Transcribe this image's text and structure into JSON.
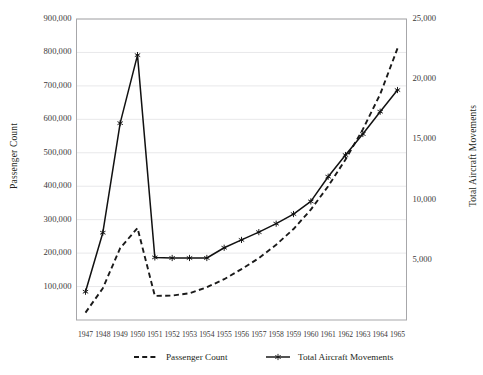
{
  "chart_data": {
    "type": "line",
    "title": "",
    "xlabel": "",
    "categories": [
      "1947",
      "1948",
      "1949",
      "1950",
      "1951",
      "1952",
      "1953",
      "1954",
      "1955",
      "1956",
      "1957",
      "1958",
      "1959",
      "1960",
      "1961",
      "1962",
      "1963",
      "1964",
      "1965"
    ],
    "grid": true,
    "legend_position": "bottom",
    "axes": {
      "left": {
        "label": "Passenger Count",
        "ticks": [
          "100,000",
          "200,000",
          "300,000",
          "400,000",
          "500,000",
          "600,000",
          "700,000",
          "800,000",
          "900,000"
        ],
        "tick_values": [
          100000,
          200000,
          300000,
          400000,
          500000,
          600000,
          700000,
          800000,
          900000
        ],
        "lim": [
          0,
          900000
        ]
      },
      "right": {
        "label": "Total Aircraft Movements",
        "ticks": [
          "5,000",
          "10,000",
          "15,000",
          "20,000",
          "25,000"
        ],
        "tick_values": [
          5000,
          10000,
          15000,
          20000,
          25000
        ],
        "lim": [
          0,
          25000
        ]
      }
    },
    "series": [
      {
        "name": "Passenger Count",
        "axis": "left",
        "style": "dashed",
        "marker": "none",
        "color": "#1a1a1a",
        "values": [
          22000,
          95000,
          215000,
          275000,
          72000,
          73000,
          80000,
          98000,
          122000,
          152000,
          185000,
          225000,
          272000,
          330000,
          400000,
          480000,
          570000,
          675000,
          812000
        ]
      },
      {
        "name": "Total Aircraft Movements",
        "axis": "right",
        "style": "solid",
        "marker": "asterisk",
        "color": "#111111",
        "values": [
          2350,
          7250,
          16350,
          22000,
          5200,
          5150,
          5150,
          5150,
          6000,
          6650,
          7300,
          8000,
          8800,
          9850,
          11900,
          13700,
          15450,
          17300,
          19100
        ]
      }
    ],
    "legend": [
      {
        "label": "Passenger Count",
        "style": "dashed",
        "marker": "none"
      },
      {
        "label": "Total Aircraft Movements",
        "style": "solid",
        "marker": "asterisk"
      }
    ]
  }
}
